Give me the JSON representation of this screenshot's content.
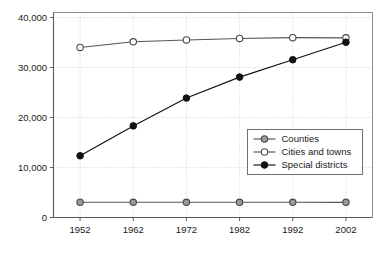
{
  "chart_data": {
    "type": "line",
    "title": "",
    "subtitle": "",
    "xlabel": "",
    "ylabel": "",
    "x": [
      1952,
      1962,
      1972,
      1982,
      1992,
      2002
    ],
    "categories": [
      "1952",
      "1962",
      "1972",
      "1982",
      "1992",
      "2002"
    ],
    "series": [
      {
        "name": "Counties",
        "values": [
          3052,
          3043,
          3044,
          3041,
          3043,
          3034
        ],
        "marker": "circle-gray-fill",
        "color": "#555555",
        "marker_fill": "#999999"
      },
      {
        "name": "Cities and towns",
        "values": [
          34009,
          35141,
          35508,
          35810,
          35962,
          35937
        ],
        "marker": "circle-open",
        "color": "#555555",
        "marker_fill": "#ffffff"
      },
      {
        "name": "Special districts",
        "values": [
          12340,
          18323,
          23885,
          28078,
          31555,
          35052
        ],
        "marker": "circle-black-fill",
        "color": "#111111",
        "marker_fill": "#111111"
      }
    ],
    "xlim": [
      1947,
      2007
    ],
    "ylim": [
      0,
      41000
    ],
    "y_ticks": [
      0,
      10000,
      20000,
      30000,
      40000
    ],
    "y_tick_labels": [
      "0",
      "10,000",
      "20,000",
      "30,000",
      "40,000"
    ],
    "x_ticks": [
      1952,
      1962,
      1972,
      1982,
      1992,
      2002
    ],
    "x_tick_labels": [
      "1952",
      "1962",
      "1972",
      "1982",
      "1992",
      "2002"
    ],
    "grid": true,
    "grid_axis": "y",
    "legend_position": "center-right",
    "legend_entries": [
      "Counties",
      "Cities and towns",
      "Special districts"
    ],
    "annotations": []
  },
  "axes": {
    "y_tick_labels": [
      "0",
      "10,000",
      "20,000",
      "30,000",
      "40,000"
    ],
    "x_tick_labels": [
      "1952",
      "1962",
      "1972",
      "1982",
      "1992",
      "2002"
    ]
  },
  "legend": {
    "items": [
      {
        "label": "Counties"
      },
      {
        "label": "Cities and towns"
      },
      {
        "label": "Special districts"
      }
    ]
  }
}
